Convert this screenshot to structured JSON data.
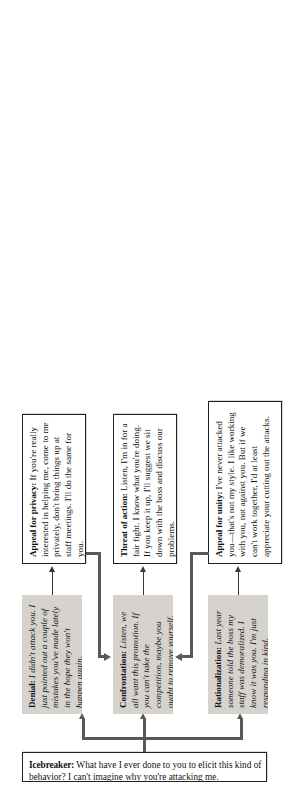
{
  "diagram": {
    "orientation": "rotated-90-ccw",
    "colors": {
      "filled_box": "#d6d3ce",
      "outline_box": "#ffffff",
      "stroke": "#23201e",
      "connector": "#3b3836",
      "connector_thick": "#5c5855"
    }
  },
  "nodes": {
    "icebreaker": {
      "label": "Icebreaker:",
      "text": " What have I ever done to you to elicit this kind of behavior? I can't imagine why you're attacking me."
    },
    "denial": {
      "label": "Denial:",
      "text": " I didn't attack you. I just pointed out a couple of mistakes you've made lately in the hope they won't happen again."
    },
    "confrontation": {
      "label": "Confrontation:",
      "text": " Listen, we all want this promotion. If you can't take the competition, maybe you ought to remove yourself."
    },
    "rationalization": {
      "label": "Rationalization:",
      "text": " Last year someone told the boss my staff was demoralized. I know it was you. I'm just responding in kind."
    },
    "appeal_privacy": {
      "label": "Appeal for privacy:",
      "text": " If you're really interested in helping me, come to me privately, don't bring things up at staff meetings. I'll do the same for you."
    },
    "threat_action": {
      "label": "Threat of action:",
      "text": " Listen, I'm in for a fair fight. I know what you're doing. If you keep it up, I'll suggest we sit down with the boss and discuss our problems."
    },
    "appeal_unity": {
      "label": "Appeal for unity:",
      "text": " I've never attacked you—that's not my style. I like working with you, not against you. But if we can't work together, I'd at least appreciate your cutting out the attacks."
    }
  },
  "connectors": [
    {
      "name": "icebreaker-to-denial",
      "from": "icebreaker",
      "to": "denial"
    },
    {
      "name": "icebreaker-to-confrontation",
      "from": "icebreaker",
      "to": "confrontation"
    },
    {
      "name": "icebreaker-to-rationalization",
      "from": "icebreaker",
      "to": "rationalization"
    },
    {
      "name": "denial-to-appeal-privacy",
      "from": "denial",
      "to": "appeal_privacy"
    },
    {
      "name": "confrontation-to-threat-action",
      "from": "confrontation",
      "to": "threat_action"
    },
    {
      "name": "rationalization-to-appeal-unity",
      "from": "rationalization",
      "to": "appeal_unity"
    },
    {
      "name": "appeal-privacy-to-confrontation",
      "from": "appeal_privacy",
      "to": "confrontation"
    },
    {
      "name": "appeal-unity-to-confrontation",
      "from": "appeal_unity",
      "to": "confrontation"
    }
  ]
}
